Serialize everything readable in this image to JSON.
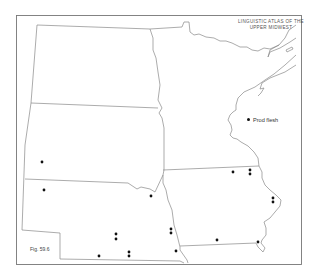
{
  "map": {
    "title_line1": "LINGUISTIC ATLAS OF THE",
    "title_line2": "UPPER MIDWEST",
    "legend_label": "Prod flesh",
    "legend_symbol": "dot",
    "figure_label": "Fig. 59.6",
    "region": "Upper Midwest: North Dakota, South Dakota, Nebraska, Minnesota, Iowa",
    "colors": {
      "line": "#888888",
      "frame": "#777777",
      "dot": "#111111",
      "background": "#ffffff"
    },
    "dots": [
      {
        "state": "South Dakota",
        "x": 42,
        "y": 162
      },
      {
        "state": "Nebraska",
        "x": 44,
        "y": 190
      },
      {
        "state": "Nebraska",
        "x": 151,
        "y": 196
      },
      {
        "state": "Nebraska",
        "x": 116,
        "y": 234
      },
      {
        "state": "Nebraska",
        "x": 116,
        "y": 239
      },
      {
        "state": "Nebraska",
        "x": 99,
        "y": 256
      },
      {
        "state": "Nebraska",
        "x": 129,
        "y": 252
      },
      {
        "state": "Nebraska",
        "x": 129,
        "y": 256
      },
      {
        "state": "Nebraska",
        "x": 171,
        "y": 229
      },
      {
        "state": "Nebraska",
        "x": 171,
        "y": 233
      },
      {
        "state": "Nebraska",
        "x": 176,
        "y": 251
      },
      {
        "state": "Iowa",
        "x": 233,
        "y": 172
      },
      {
        "state": "Iowa",
        "x": 250,
        "y": 170
      },
      {
        "state": "Iowa",
        "x": 250,
        "y": 174
      },
      {
        "state": "Iowa",
        "x": 273,
        "y": 198
      },
      {
        "state": "Iowa",
        "x": 273,
        "y": 202
      },
      {
        "state": "Iowa",
        "x": 217,
        "y": 240
      },
      {
        "state": "Iowa",
        "x": 258,
        "y": 242
      }
    ]
  }
}
